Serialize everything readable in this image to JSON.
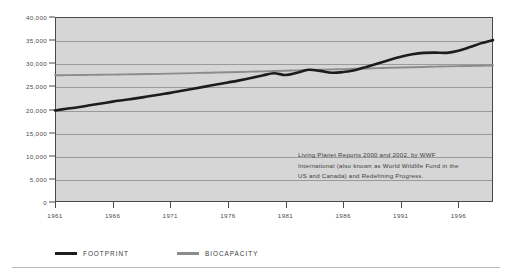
{
  "chart_data": {
    "type": "line",
    "title": "",
    "xlabel": "",
    "ylabel": "",
    "xlim": [
      1961,
      1999
    ],
    "ylim": [
      0,
      40000
    ],
    "grid": true,
    "legend_position": "bottom-left",
    "x_tick_labels": [
      "1961",
      "1966",
      "1971",
      "1976",
      "1981",
      "1986",
      "1991",
      "1996"
    ],
    "x_tick_values": [
      1961,
      1966,
      1971,
      1976,
      1981,
      1986,
      1991,
      1996
    ],
    "y_tick_labels": [
      "0",
      "5,000",
      "10,000",
      "15,000",
      "20,000",
      "25,000",
      "30,000",
      "35,000",
      "40,000"
    ],
    "y_tick_values": [
      0,
      5000,
      10000,
      15000,
      20000,
      25000,
      30000,
      35000,
      40000
    ],
    "x": [
      1961,
      1962,
      1963,
      1964,
      1965,
      1966,
      1967,
      1968,
      1969,
      1970,
      1971,
      1972,
      1973,
      1974,
      1975,
      1976,
      1977,
      1978,
      1979,
      1980,
      1981,
      1982,
      1983,
      1984,
      1985,
      1986,
      1987,
      1988,
      1989,
      1990,
      1991,
      1992,
      1993,
      1994,
      1995,
      1996,
      1997,
      1998,
      1999
    ],
    "series": [
      {
        "name": "FOOTPRINT",
        "color": "#1c1c1c",
        "values": [
          19800,
          20150,
          20500,
          20900,
          21300,
          21700,
          22050,
          22400,
          22800,
          23200,
          23600,
          24050,
          24500,
          24950,
          25400,
          25850,
          26300,
          26800,
          27350,
          27850,
          27450,
          27950,
          28600,
          28350,
          27950,
          28100,
          28500,
          29200,
          29950,
          30700,
          31400,
          31950,
          32250,
          32300,
          32250,
          32700,
          33500,
          34350,
          35000
        ]
      },
      {
        "name": "BIOCAPACITY",
        "color": "#8c8c8c",
        "values": [
          27400,
          27430,
          27460,
          27490,
          27520,
          27550,
          27590,
          27630,
          27670,
          27710,
          27760,
          27810,
          27870,
          27930,
          27990,
          28050,
          28110,
          28180,
          28250,
          28320,
          28390,
          28460,
          28530,
          28600,
          28670,
          28740,
          28810,
          28880,
          28950,
          29020,
          29080,
          29140,
          29200,
          29260,
          29320,
          29370,
          29420,
          29470,
          29500
        ]
      }
    ],
    "annotation": {
      "line1": "Living Planet Reports 2000 and 2002, by WWF",
      "line2": "International (also known as World Wildlife Fund in the",
      "line3": "US and Canada) and Redefining Progress."
    }
  },
  "legend": {
    "items": [
      {
        "label": "FOOTPRINT",
        "color": "#1c1c1c"
      },
      {
        "label": "BIOCAPACITY",
        "color": "#8c8c8c"
      }
    ]
  },
  "colors": {
    "plot_background": "#d6d6d6",
    "gridline": "#9a9a9a",
    "axis": "#4a4a4a",
    "footprint": "#1c1c1c",
    "biocapacity": "#8c8c8c",
    "page_background": "#ffffff",
    "rule": "#b9b9b9"
  }
}
